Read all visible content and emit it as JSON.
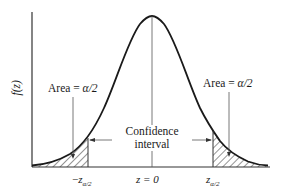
{
  "diagram": {
    "type": "normal-distribution-confidence-interval",
    "y_axis_label": "f(z)",
    "left_tail_label": {
      "prefix": "Area = ",
      "symbol": "α/2"
    },
    "right_tail_label": {
      "prefix": "Area = ",
      "symbol": "α/2"
    },
    "interval_label": {
      "line1": "Confidence",
      "line2": "interval"
    },
    "x_labels": {
      "left": {
        "sign": "−",
        "var": "z",
        "sub": "α/2"
      },
      "center": {
        "text": "z = 0"
      },
      "right": {
        "var": "z",
        "sub": "α/2"
      }
    },
    "colors": {
      "curve": "#1a1a1a",
      "axis": "#333333",
      "hatch": "#2a2a2a",
      "leader": "#555555"
    }
  }
}
